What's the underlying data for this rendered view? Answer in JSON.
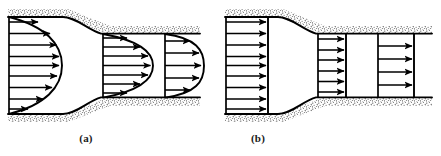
{
  "figure": {
    "type": "technical-line-diagram",
    "background_color": "#ffffff",
    "line_color": "#000000",
    "wall_hatch_color": "#4d4d4d",
    "panels": [
      {
        "id": "a",
        "caption": "(a)",
        "description": "Parabolic (fully developed viscous) velocity profiles at three stations",
        "profile_shape": "parabolic",
        "station_count": 3,
        "arrow_counts": [
          9,
          7,
          5
        ]
      },
      {
        "id": "b",
        "caption": "(b)",
        "description": "Uniform (inviscid / plug flow) velocity profiles at three stations",
        "profile_shape": "uniform",
        "station_count": 3,
        "arrow_counts": [
          9,
          6,
          4
        ]
      }
    ],
    "captions": {
      "a": "(a)",
      "b": "(b)"
    }
  }
}
